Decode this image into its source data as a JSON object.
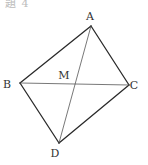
{
  "header": {
    "partial_text": "題 4"
  },
  "diagram": {
    "type": "quadrilateral-with-diagonals",
    "stroke_color": "#2a2a2a",
    "diagonal_color": "#555555",
    "points": {
      "A": {
        "label": "A",
        "x": 91,
        "y": 26,
        "lx": 90,
        "ly": 20
      },
      "B": {
        "label": "B",
        "x": 20,
        "y": 83,
        "lx": 7,
        "ly": 88
      },
      "C": {
        "label": "C",
        "x": 129,
        "y": 85,
        "lx": 134,
        "ly": 89
      },
      "D": {
        "label": "D",
        "x": 59,
        "y": 143,
        "lx": 55,
        "ly": 157
      },
      "M": {
        "label": "M",
        "x": 75,
        "y": 84,
        "lx": 64,
        "ly": 79
      }
    },
    "sides": [
      "AB",
      "BD",
      "DC",
      "CA"
    ],
    "diagonals": [
      "AD",
      "BC"
    ]
  }
}
